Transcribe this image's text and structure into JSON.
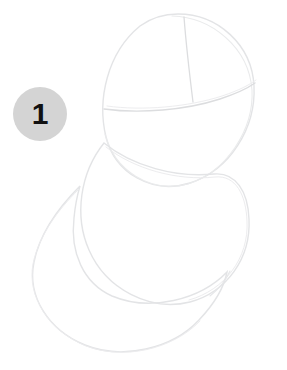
{
  "page": {
    "background_color": "#ffffff",
    "width": 287,
    "height": 370
  },
  "step_badge": {
    "number": "1",
    "fill_color": "#d4d4d4",
    "text_color": "#111111",
    "diameter": 54,
    "center_x": 40,
    "center_y": 114
  },
  "drawing": {
    "subject": "construction-sketch",
    "line_color": "#e2e3e5",
    "accent_line_color": "#dadbdd",
    "stroke_width": 1.3,
    "shapes": [
      {
        "name": "head-circle",
        "type": "ellipse",
        "cx": 179,
        "cy": 100,
        "rx": 76,
        "ry": 86,
        "description": "Large upper circle representing the head"
      },
      {
        "name": "head-vertical-guideline",
        "type": "curve",
        "description": "Vertical center construction line on head",
        "path": "M 184 16 C 186 42, 189 68, 193 102"
      },
      {
        "name": "head-brow-guideline",
        "type": "curve",
        "description": "Horizontal brow construction line curving up to the right",
        "path": "M 104 109 C 146 113, 200 104, 254 84"
      },
      {
        "name": "middle-oval",
        "type": "ellipse",
        "cx": 158,
        "cy": 225,
        "rx": 93,
        "ry": 83,
        "description": "Middle overlapping oval for upper body"
      },
      {
        "name": "bottom-oval",
        "type": "ellipse",
        "cx": 130,
        "cy": 268,
        "rx": 97,
        "ry": 83,
        "description": "Lower left large oval for lower body"
      }
    ]
  }
}
